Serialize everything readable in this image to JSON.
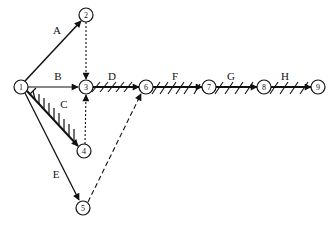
{
  "diagram": {
    "type": "activity-on-arrow network",
    "nodes": [
      {
        "id": "1",
        "label": "1",
        "x": 21,
        "y": 87
      },
      {
        "id": "2",
        "label": "2",
        "x": 86,
        "y": 15
      },
      {
        "id": "3",
        "label": "3",
        "x": 86,
        "y": 87
      },
      {
        "id": "4",
        "label": "4",
        "x": 84,
        "y": 151
      },
      {
        "id": "5",
        "label": "5",
        "x": 83,
        "y": 208
      },
      {
        "id": "6",
        "label": "6",
        "x": 146,
        "y": 87
      },
      {
        "id": "7",
        "label": "7",
        "x": 209,
        "y": 87
      },
      {
        "id": "8",
        "label": "8",
        "x": 264,
        "y": 87
      },
      {
        "id": "9",
        "label": "9",
        "x": 318,
        "y": 87
      }
    ],
    "edges": [
      {
        "from": "1",
        "to": "2",
        "label": "A",
        "style": "solid",
        "critical": false
      },
      {
        "from": "1",
        "to": "3",
        "label": "B",
        "style": "solid",
        "critical": false
      },
      {
        "from": "1",
        "to": "4",
        "label": "C",
        "style": "solid",
        "critical": true
      },
      {
        "from": "1",
        "to": "5",
        "label": "E",
        "style": "solid",
        "critical": false
      },
      {
        "from": "2",
        "to": "3",
        "label": "",
        "style": "dotted",
        "critical": false
      },
      {
        "from": "4",
        "to": "3",
        "label": "",
        "style": "dotted",
        "critical": false
      },
      {
        "from": "5",
        "to": "6",
        "label": "",
        "style": "dashed",
        "critical": false
      },
      {
        "from": "3",
        "to": "6",
        "label": "D",
        "style": "solid",
        "critical": true
      },
      {
        "from": "6",
        "to": "7",
        "label": "F",
        "style": "solid",
        "critical": true
      },
      {
        "from": "7",
        "to": "8",
        "label": "G",
        "style": "solid",
        "critical": true
      },
      {
        "from": "8",
        "to": "9",
        "label": "H",
        "style": "solid",
        "critical": true
      }
    ],
    "labels": {
      "A": "A",
      "B": "B",
      "C": "C",
      "D": "D",
      "E": "E",
      "F": "F",
      "G": "G",
      "H": "H"
    },
    "colors": {
      "stroke": "#111111",
      "background": "#ffffff"
    }
  }
}
